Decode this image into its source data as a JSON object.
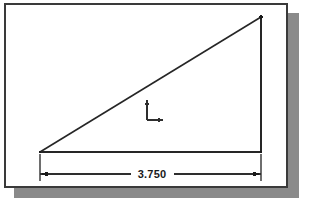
{
  "sheet": {
    "name": "drawing-sheet",
    "background_color": "#ffffff",
    "border_color": "#3a3a3a",
    "shadow_color": "#8a8a8a",
    "border_rect": {
      "x": 4,
      "y": 3,
      "width": 283,
      "height": 184
    },
    "shadow_rect": {
      "x": 14,
      "y": 13,
      "width": 285,
      "height": 185
    }
  },
  "drawing": {
    "name": "right-triangle-with-dimension",
    "line_color": "#262626",
    "units": "inches",
    "geometry": {
      "triangle": {
        "vertices": [
          {
            "label": "bottom-left",
            "x": 40,
            "y": 152
          },
          {
            "label": "top-right",
            "x": 261,
            "y": 17
          },
          {
            "label": "bottom-right",
            "x": 261,
            "y": 152
          }
        ],
        "edges": [
          {
            "label": "hypotenuse",
            "x1": 40,
            "y1": 152,
            "x2": 261,
            "y2": 17
          },
          {
            "label": "vertical-leg",
            "x1": 261,
            "y1": 17,
            "x2": 261,
            "y2": 152
          },
          {
            "label": "base-leg",
            "x1": 40,
            "y1": 152,
            "x2": 261,
            "y2": 152
          }
        ]
      },
      "dimension": {
        "label": "3.750",
        "orientation": "horizontal",
        "line_y": 174,
        "x_start": 40,
        "x_end": 261,
        "text_x": 152,
        "text_y": 178,
        "extension_lines": [
          {
            "x": 40,
            "y1": 152,
            "y2": 180
          },
          {
            "x": 261,
            "y1": 152,
            "y2": 180
          }
        ],
        "arrowheads": [
          {
            "at": "left",
            "x": 40,
            "y": 174,
            "direction": "right"
          },
          {
            "at": "right",
            "x": 261,
            "y": 174,
            "direction": "left"
          }
        ]
      },
      "ucs_icon": {
        "label": "ucs-coordinate-axes",
        "origin_x": 147,
        "origin_y": 120,
        "y_axis_top": 100,
        "x_axis_end": 163
      }
    }
  },
  "labels": {
    "dimension_value": "3.750"
  }
}
